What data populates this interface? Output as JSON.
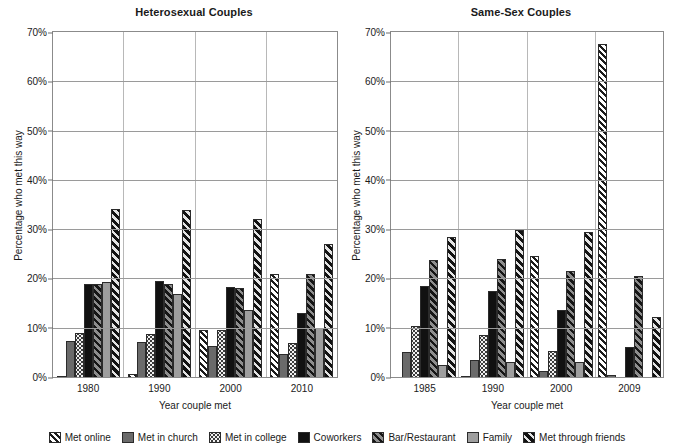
{
  "chart_data": [
    {
      "type": "bar",
      "title": "Heterosexual Couples",
      "xlabel": "Year couple met",
      "ylabel": "Percentage who met this way",
      "ylim": [
        0,
        70
      ],
      "yticks": [
        "0%",
        "10%",
        "20%",
        "30%",
        "40%",
        "50%",
        "60%",
        "70%"
      ],
      "ytick_values": [
        0,
        10,
        20,
        30,
        40,
        50,
        60,
        70
      ],
      "grid": true,
      "legend_position": "bottom",
      "categories": [
        "1980",
        "1990",
        "2000",
        "2010"
      ],
      "series": [
        {
          "name": "Met online",
          "values": [
            0.2,
            0.6,
            9.5,
            21.0
          ]
        },
        {
          "name": "Met in church",
          "values": [
            7.4,
            7.2,
            6.3,
            4.7
          ]
        },
        {
          "name": "Met in college",
          "values": [
            9.0,
            8.8,
            9.5,
            7.0
          ]
        },
        {
          "name": "Coworkers",
          "values": [
            18.8,
            19.5,
            18.2,
            13.0
          ]
        },
        {
          "name": "Bar/Restaurant",
          "values": [
            18.8,
            18.8,
            18.0,
            21.0
          ]
        },
        {
          "name": "Family",
          "values": [
            19.2,
            16.8,
            13.5,
            10.0
          ]
        },
        {
          "name": "Met through friends",
          "values": [
            34.0,
            33.8,
            32.0,
            27.0
          ]
        }
      ]
    },
    {
      "type": "bar",
      "title": "Same-Sex Couples",
      "xlabel": "Year couple met",
      "ylabel": "Percentage who met this way",
      "ylim": [
        0,
        70
      ],
      "yticks": [
        "0%",
        "10%",
        "20%",
        "30%",
        "40%",
        "50%",
        "60%",
        "70%"
      ],
      "ytick_values": [
        0,
        10,
        20,
        30,
        40,
        50,
        60,
        70
      ],
      "grid": true,
      "legend_position": "bottom",
      "categories": [
        "1985",
        "1990",
        "2000",
        "2009"
      ],
      "series": [
        {
          "name": "Met online",
          "values": [
            0.0,
            0.3,
            24.5,
            67.5
          ]
        },
        {
          "name": "Met in church",
          "values": [
            5.0,
            3.5,
            1.3,
            0.5
          ]
        },
        {
          "name": "Met in college",
          "values": [
            10.4,
            8.5,
            5.3,
            0.0
          ]
        },
        {
          "name": "Coworkers",
          "values": [
            18.5,
            17.5,
            13.5,
            6.0
          ]
        },
        {
          "name": "Bar/Restaurant",
          "values": [
            23.8,
            24.0,
            21.5,
            20.5
          ]
        },
        {
          "name": "Family",
          "values": [
            2.5,
            3.0,
            3.0,
            0.0
          ]
        },
        {
          "name": "Met through friends",
          "values": [
            28.5,
            29.8,
            29.5,
            12.2
          ]
        }
      ]
    }
  ],
  "legend": {
    "items": [
      {
        "label": "Met online",
        "pattern": "p-online"
      },
      {
        "label": "Met in church",
        "pattern": "p-church"
      },
      {
        "label": "Met in college",
        "pattern": "p-college"
      },
      {
        "label": "Coworkers",
        "pattern": "p-coworkers"
      },
      {
        "label": "Bar/Restaurant",
        "pattern": "p-bar"
      },
      {
        "label": "Family",
        "pattern": "p-family"
      },
      {
        "label": "Met through friends",
        "pattern": "p-friends"
      }
    ]
  }
}
